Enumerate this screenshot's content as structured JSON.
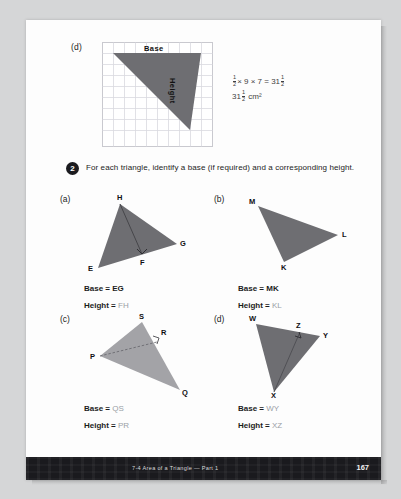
{
  "page": {
    "background_color": "#d5d6d7",
    "sheet_color": "#fdfdfd",
    "fill_dark": "#6e6e72",
    "fill_light": "#a3a3a7",
    "answer_color": "#9aa0a6"
  },
  "example": {
    "label": "(d)",
    "base_label": "Base",
    "height_label": "Height",
    "calc_line1_prefix": "",
    "calc_half_num": "1",
    "calc_half_den": "2",
    "calc_mid": "× 9 × 7 =",
    "calc_result_whole": "31",
    "calc_result_num": "1",
    "calc_result_den": "2",
    "calc_line2_whole": "31",
    "calc_line2_num": "1",
    "calc_line2_den": "2",
    "calc_line2_unit": "cm²",
    "grid": {
      "cols": 10,
      "rows": 10,
      "cell": 11
    }
  },
  "question": {
    "number": "2",
    "text": "For each triangle, identify a base (if required) and a corresponding height."
  },
  "items": [
    {
      "label": "(a)",
      "vertices": [
        "H",
        "G",
        "F",
        "E"
      ],
      "base_label": "Base =",
      "base_value": "EG",
      "base_is_answer": false,
      "height_label": "Height =",
      "height_value": "FH",
      "height_is_answer": true
    },
    {
      "label": "(b)",
      "vertices": [
        "M",
        "L",
        "K"
      ],
      "base_label": "Base =",
      "base_value": "MK",
      "base_is_answer": false,
      "height_label": "Height =",
      "height_value": "KL",
      "height_is_answer": true
    },
    {
      "label": "(c)",
      "vertices": [
        "S",
        "R",
        "P",
        "Q"
      ],
      "base_label": "Base =",
      "base_value": "QS",
      "base_is_answer": true,
      "height_label": "Height =",
      "height_value": "PR",
      "height_is_answer": true
    },
    {
      "label": "(d)",
      "vertices": [
        "W",
        "Z",
        "Y",
        "X"
      ],
      "base_label": "Base =",
      "base_value": "WY",
      "base_is_answer": true,
      "height_label": "Height =",
      "height_value": "XZ",
      "height_is_answer": true
    }
  ],
  "footer": {
    "text": "7-4  Area of a Triangle — Part 1",
    "page_number": "167"
  }
}
